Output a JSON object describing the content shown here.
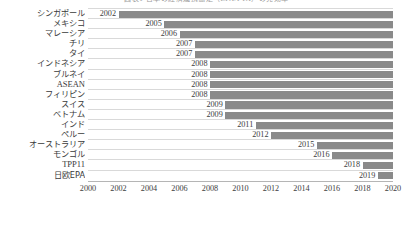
{
  "title": {
    "text": "図表1 日本の経済連携協定（EPA/FTA）の発効年",
    "visible_note": "cropped at top edge"
  },
  "chart_data": {
    "type": "bar",
    "orientation": "horizontal",
    "title": "図表1 日本の経済連携協定（EPA/FTA）の発効年",
    "xlabel": "",
    "ylabel": "",
    "xlim": [
      2000,
      2020
    ],
    "xticks": [
      2000,
      2002,
      2004,
      2006,
      2008,
      2010,
      2012,
      2014,
      2016,
      2018,
      2020
    ],
    "grid": true,
    "legend": "none",
    "note": "Each bar spans from its start year to 2020; the number at the left end of each bar is the start year.",
    "bar_color": "#8a8a8a",
    "bar_end": 2020,
    "categories": [
      "シンガポール",
      "メキシコ",
      "マレーシア",
      "チリ",
      "タイ",
      "インドネシア",
      "ブルネイ",
      "ASEAN",
      "フィリピン",
      "スイス",
      "ベトナム",
      "インド",
      "ペルー",
      "オーストラリア",
      "モンゴル",
      "TPP11",
      "日欧EPA"
    ],
    "values": [
      2002,
      2005,
      2006,
      2007,
      2007,
      2008,
      2008,
      2008,
      2008,
      2009,
      2009,
      2011,
      2012,
      2015,
      2016,
      2018,
      2019
    ]
  },
  "rows": [
    {
      "label": "シンガポール",
      "year": "2002",
      "start": 2002,
      "latin": false
    },
    {
      "label": "メキシコ",
      "year": "2005",
      "start": 2005,
      "latin": false
    },
    {
      "label": "マレーシア",
      "year": "2006",
      "start": 2006,
      "latin": false
    },
    {
      "label": "チリ",
      "year": "2007",
      "start": 2007,
      "latin": false
    },
    {
      "label": "タイ",
      "year": "2007",
      "start": 2007,
      "latin": false
    },
    {
      "label": "インドネシア",
      "year": "2008",
      "start": 2008,
      "latin": false
    },
    {
      "label": "ブルネイ",
      "year": "2008",
      "start": 2008,
      "latin": false
    },
    {
      "label": "ASEAN",
      "year": "2008",
      "start": 2008,
      "latin": true
    },
    {
      "label": "フィリピン",
      "year": "2008",
      "start": 2008,
      "latin": false
    },
    {
      "label": "スイス",
      "year": "2009",
      "start": 2009,
      "latin": false
    },
    {
      "label": "ベトナム",
      "year": "2009",
      "start": 2009,
      "latin": false
    },
    {
      "label": "インド",
      "year": "2011",
      "start": 2011,
      "latin": false
    },
    {
      "label": "ペルー",
      "year": "2012",
      "start": 2012,
      "latin": false
    },
    {
      "label": "オーストラリア",
      "year": "2015",
      "start": 2015,
      "latin": false
    },
    {
      "label": "モンゴル",
      "year": "2016",
      "start": 2016,
      "latin": false
    },
    {
      "label": "TPP11",
      "year": "2018",
      "start": 2018,
      "latin": true
    },
    {
      "label": "日欧EPA",
      "year": "2019",
      "start": 2019,
      "latin": false
    }
  ],
  "axis": {
    "ticks": [
      "2000",
      "2002",
      "2004",
      "2006",
      "2008",
      "2010",
      "2012",
      "2014",
      "2016",
      "2018",
      "2020"
    ],
    "min": 2000,
    "max": 2020
  },
  "colors": {
    "bar": "#8a8a8a",
    "gridline": "#d9d9d9",
    "axis_line": "#b5b5b5",
    "text": "#3d3d3d",
    "background": "#ffffff"
  }
}
